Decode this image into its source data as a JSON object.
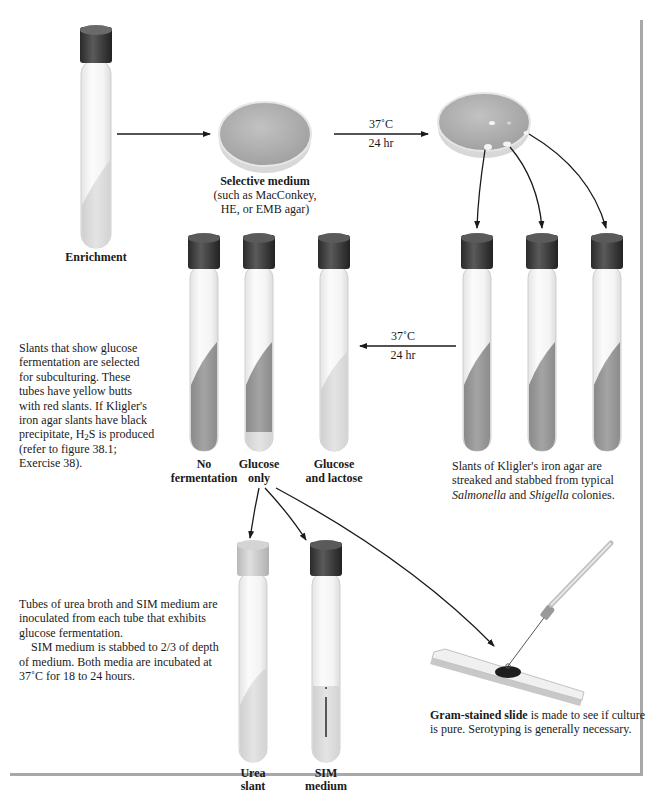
{
  "figure": {
    "enrichment_label": "Enrichment",
    "selective_medium": {
      "title": "Selective medium",
      "line1": "(such as MacConkey,",
      "line2": "HE, or EMB agar)"
    },
    "incubation_1": {
      "temp": "37˚C",
      "time": "24 hr"
    },
    "incubation_2": {
      "temp": "37˚C",
      "time": "24 hr"
    },
    "kia_tubes": {
      "caption_line1": "Slants of Kligler's iron agar are",
      "caption_line2": "streaked and stabbed from typical",
      "caption_line3_italic1": "Salmonella",
      "caption_line3_mid": " and ",
      "caption_line3_italic2": "Shigella",
      "caption_line3_end": " colonies."
    },
    "result_tubes": [
      {
        "line1": "No",
        "line2": "fermentation"
      },
      {
        "line1": "Glucose",
        "line2": "only"
      },
      {
        "line1": "Glucose",
        "line2": "and lactose"
      }
    ],
    "left_note": {
      "lines": [
        "Slants that show glucose",
        "fermentation are selected",
        "for subculturing. These",
        "tubes have yellow butts",
        "with red slants. If Kligler's",
        "iron agar slants have black"
      ],
      "h2s_pre": "precipitate, H",
      "h2s_sub": "2",
      "h2s_post": "S is produced",
      "line_ref1": "(refer to figure 38.1;",
      "line_ref2": "Exercise 38)."
    },
    "urea_sim_note": {
      "p1_lines": [
        "Tubes of urea broth and SIM medium are",
        "inoculated from each tube that exhibits",
        "glucose fermentation."
      ],
      "p2_lines": [
        "SIM medium is stabbed to 2/3 of depth",
        "of medium.  Both media are incubated at",
        "37˚C for 18 to 24 hours."
      ]
    },
    "urea_tube": {
      "line1": "Urea",
      "line2": "slant"
    },
    "sim_tube": {
      "line1": "SIM",
      "line2": "medium"
    },
    "gram_slide": {
      "bold": "Gram-stained slide",
      "rest1": " is made to see if culture",
      "line2": "is pure.  Serotyping is generally necessary."
    },
    "colors": {
      "cap": "#3a3a3a",
      "agar": "#9a9a9a",
      "glass": "#f2f2f2",
      "plate": "#b0b0b0",
      "arrow": "#1a1a1a",
      "frame": "#a8a8a8"
    }
  }
}
